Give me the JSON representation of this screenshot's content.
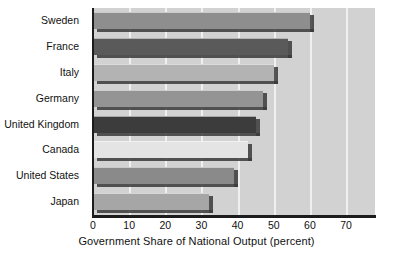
{
  "chart_data": {
    "type": "bar",
    "orientation": "horizontal",
    "title": "",
    "xlabel": "Government Share of National Output (percent)",
    "ylabel": "",
    "categories": [
      "Sweden",
      "France",
      "Italy",
      "Germany",
      "United Kingdom",
      "Canada",
      "United States",
      "Japan"
    ],
    "values": [
      60,
      54,
      50,
      47,
      45,
      43,
      39,
      32
    ],
    "xlim": [
      0,
      78
    ],
    "xticks": [
      0,
      10,
      20,
      30,
      40,
      50,
      60,
      70
    ],
    "xticklabels": [
      "0",
      "10",
      "20",
      "30",
      "40",
      "50",
      "60",
      "70"
    ],
    "grid": "vertical-only",
    "legend": "none",
    "bar_colors": [
      "#8e8e8e",
      "#5a5a5a",
      "#b3b3b3",
      "#949494",
      "#3c3c3c",
      "#e4e4e4",
      "#8a8a8a",
      "#a6a6a6"
    ],
    "plot_background": "#d2d2d2",
    "gridline_color": "#f0f0f0",
    "axis_color": "#1c1c1c",
    "shadow_color": "#3a3a3a"
  }
}
